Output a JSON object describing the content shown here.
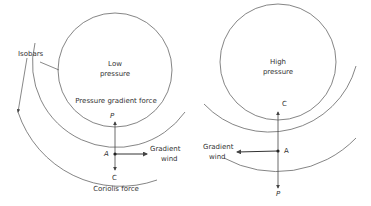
{
  "diagram": {
    "stroke_color": "#555555",
    "left": {
      "center_label_line1": "Low",
      "center_label_line2": "pressure",
      "pgf_label": "Pressure gradient force",
      "isobars_label": "Isobars",
      "point_label": "A",
      "p_label": "P",
      "c_label": "C",
      "wind_label_line1": "Gradient",
      "wind_label_line2": "wind",
      "coriolis_label": "Coriolis force"
    },
    "right": {
      "center_label_line1": "High",
      "center_label_line2": "pressure",
      "point_label": "A",
      "p_label": "P",
      "c_label": "C",
      "wind_label_line1": "Gradient",
      "wind_label_line2": "wind"
    }
  }
}
